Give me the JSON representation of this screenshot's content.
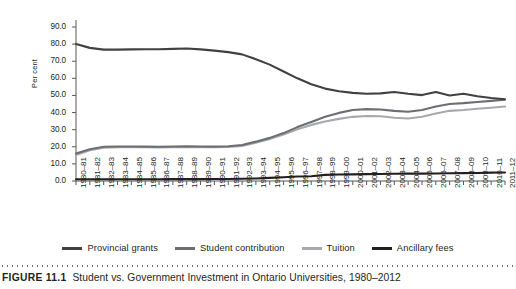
{
  "caption": {
    "figure_number": "FIGURE 11.1",
    "title": "Student vs. Government Investment in Ontario Universities, 1980–2012"
  },
  "axes": {
    "ylabel": "Per cent",
    "yticks": [
      "0.0",
      "10.0",
      "20.0",
      "30.0",
      "40.0",
      "50.0",
      "60.0",
      "70.0",
      "80.0",
      "90.0"
    ]
  },
  "legend": [
    {
      "label": "Provincial grants",
      "color": "#414042"
    },
    {
      "label": "Student contribution",
      "color": "#6d6e71"
    },
    {
      "label": "Tuition",
      "color": "#a7a9ac"
    },
    {
      "label": "Ancillary fees",
      "color": "#231f20"
    }
  ],
  "chart_data": {
    "type": "line",
    "title": "Student vs. Government Investment in Ontario Universities, 1980–2012",
    "xlabel": "",
    "ylabel": "Per cent",
    "ylim": [
      0,
      90
    ],
    "grid": false,
    "legend_position": "bottom",
    "categories": [
      "1980–81",
      "1981–82",
      "1982–83",
      "1983–84",
      "1984–85",
      "1985–86",
      "1986–87",
      "1987–88",
      "1988–89",
      "1989–90",
      "1990–91",
      "1991–92",
      "1992–93",
      "1993–94",
      "1994–95",
      "1995–96",
      "1996–97",
      "1997–98",
      "1998–99",
      "1999–00",
      "2000–01",
      "2001–02",
      "2002–03",
      "2003–04",
      "2004–05",
      "2005–06",
      "2006–07",
      "2007–08",
      "2008–09",
      "2009–10",
      "2010–11",
      "2011–12"
    ],
    "series": [
      {
        "name": "Provincial grants",
        "color": "#414042",
        "values": [
          80.0,
          77.8,
          76.8,
          76.8,
          76.9,
          77.0,
          77.0,
          77.2,
          77.4,
          76.9,
          76.2,
          75.3,
          74.0,
          71.2,
          68.0,
          64.0,
          60.0,
          56.5,
          54.0,
          52.5,
          51.5,
          51.0,
          51.2,
          52.0,
          51.0,
          50.2,
          52.0,
          50.0,
          51.0,
          49.5,
          48.5,
          47.8
        ]
      },
      {
        "name": "Student contribution",
        "color": "#6d6e71",
        "values": [
          16.0,
          18.6,
          20.0,
          20.2,
          20.2,
          20.1,
          20.0,
          20.2,
          20.3,
          20.2,
          20.1,
          20.3,
          21.0,
          23.0,
          25.2,
          28.0,
          31.5,
          34.5,
          37.5,
          39.8,
          41.5,
          42.0,
          41.8,
          41.0,
          40.5,
          41.5,
          43.5,
          45.0,
          45.5,
          46.2,
          46.8,
          47.5
        ]
      },
      {
        "name": "Tuition",
        "color": "#a7a9ac",
        "values": [
          15.2,
          18.0,
          19.5,
          19.8,
          19.8,
          19.7,
          19.6,
          19.8,
          19.9,
          19.8,
          19.7,
          19.9,
          20.5,
          22.4,
          24.5,
          27.2,
          30.3,
          32.8,
          34.8,
          36.3,
          37.5,
          38.0,
          37.8,
          37.0,
          36.5,
          37.5,
          39.5,
          41.0,
          41.5,
          42.2,
          42.8,
          43.5
        ]
      },
      {
        "name": "Ancillary fees",
        "color": "#231f20",
        "values": [
          1.0,
          1.0,
          1.0,
          1.0,
          1.0,
          1.0,
          1.0,
          1.1,
          1.1,
          1.1,
          1.2,
          1.2,
          1.3,
          1.5,
          1.8,
          2.2,
          2.6,
          2.8,
          3.6,
          3.8,
          3.9,
          4.0,
          4.1,
          4.2,
          4.3,
          4.3,
          4.4,
          4.5,
          4.6,
          4.7,
          4.9,
          5.0
        ]
      }
    ]
  }
}
